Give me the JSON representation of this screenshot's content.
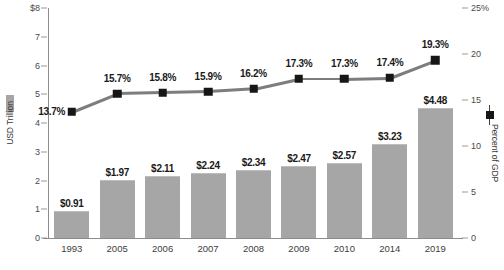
{
  "chart_data": {
    "type": "bar",
    "title": "",
    "subtitle": "",
    "categories": [
      "1993",
      "2005",
      "2006",
      "2007",
      "2008",
      "2009",
      "2010",
      "2014",
      "2019"
    ],
    "series": [
      {
        "name": "USD Trillion",
        "type": "bar",
        "axis": "left",
        "values": [
          0.91,
          1.97,
          2.11,
          2.24,
          2.34,
          2.47,
          2.57,
          3.23,
          4.48
        ],
        "data_labels": [
          "$0.91",
          "$1.97",
          "$2.11",
          "$2.24",
          "$2.34",
          "$2.47",
          "$2.57",
          "$3.23",
          "$4.48"
        ],
        "color": "#a6a6a6"
      },
      {
        "name": "Percent of GDP",
        "type": "line",
        "axis": "right",
        "values": [
          13.7,
          15.7,
          15.8,
          15.9,
          16.2,
          17.3,
          17.3,
          17.4,
          19.3
        ],
        "data_labels": [
          "13.7%",
          "15.7%",
          "15.8%",
          "15.9%",
          "16.2%",
          "17.3%",
          "17.3%",
          "17.4%",
          "19.3%"
        ],
        "color": "#161616",
        "line_color": "#7d7d7d"
      }
    ],
    "xlabel": "",
    "ylabel": "USD Trillion",
    "y2label": "Percent of GDP",
    "ylim": [
      0,
      8
    ],
    "y2lim": [
      0,
      25
    ],
    "yticks": [
      "0",
      "1",
      "2",
      "3",
      "4",
      "5",
      "6",
      "7",
      "$8"
    ],
    "ytick_values": [
      0,
      1,
      2,
      3,
      4,
      5,
      6,
      7,
      8
    ],
    "y2ticks": [
      "0",
      "5",
      "10",
      "15",
      "20",
      "25%"
    ],
    "y2tick_values": [
      0,
      5,
      10,
      15,
      20,
      25
    ],
    "grid": false,
    "legend_position": "axis-titles"
  },
  "axes": {
    "left_title": "USD Trillion",
    "right_title": "Percent of GDP"
  },
  "footer": {
    "source_note": ""
  }
}
